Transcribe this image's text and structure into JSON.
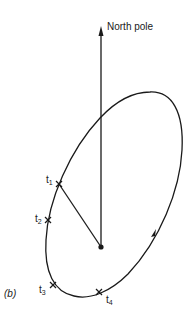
{
  "diagram": {
    "panel_label": "(b)",
    "axis_label": "North pole",
    "points": [
      {
        "id": "t1",
        "base": "t",
        "sub": "1"
      },
      {
        "id": "t2",
        "base": "t",
        "sub": "2"
      },
      {
        "id": "t3",
        "base": "t",
        "sub": "3"
      },
      {
        "id": "t4",
        "base": "t",
        "sub": "4"
      }
    ],
    "colors": {
      "stroke": "#1a1a1a",
      "background": "#ffffff"
    }
  }
}
